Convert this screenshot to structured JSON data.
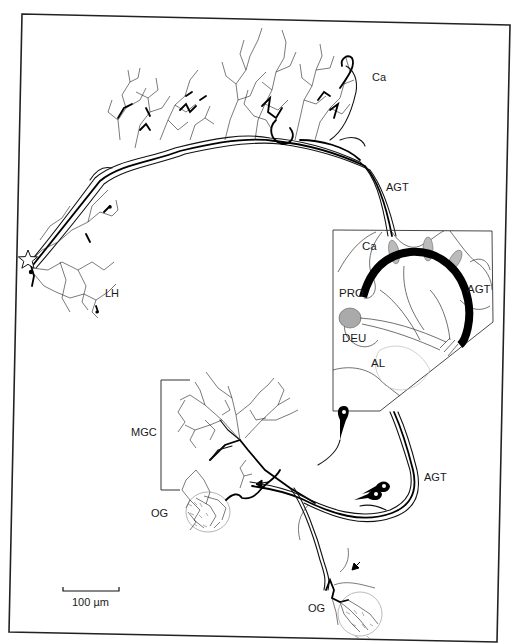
{
  "figure": {
    "type": "neuron-tracing-line-drawing",
    "background": "#ffffff",
    "ink": "#111111",
    "frame": {
      "tl": [
        22,
        14
      ],
      "tr": [
        510,
        25
      ],
      "br": [
        497,
        642
      ],
      "bl": [
        9,
        632
      ]
    }
  },
  "labels": {
    "calyx": "Ca",
    "agt_top": "AGT",
    "lateral_horn": "LH",
    "mgc": "MGC",
    "og_upper": "OG",
    "og_lower": "OG",
    "agt_bottom": "AGT",
    "scale_bar": "100 µm"
  },
  "inset": {
    "labels": {
      "calyx": "Ca",
      "protocerebrum": "PRO",
      "agt": "AGT",
      "deutocerebrum": "DEU",
      "antennal_lobe": "AL"
    }
  },
  "markers": {
    "star": "star-marker",
    "arrows": [
      "arrow-upper-og",
      "arrow-lower-og"
    ]
  }
}
